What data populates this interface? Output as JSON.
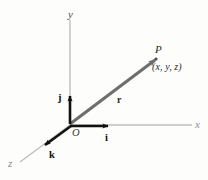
{
  "figure": {
    "background_color": "#fdfdfb",
    "axis_color": "#b9b9b9",
    "vector_color": "#6e6e6e",
    "unit_vector_color": "#111111"
  },
  "axes": {
    "x_label": "x",
    "y_label": "y",
    "z_label": "z",
    "origin_label": "O"
  },
  "point": {
    "name": "P",
    "coordinates": "(x, y, z)"
  },
  "vectors": {
    "position_label": "r",
    "unit_x_label": "i",
    "unit_y_label": "j",
    "unit_z_label": "k"
  }
}
